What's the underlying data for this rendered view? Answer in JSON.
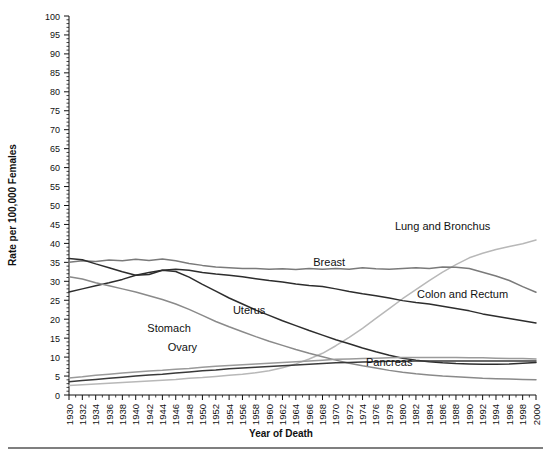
{
  "chart_data": {
    "type": "line",
    "title": "",
    "xlabel": "Year of Death",
    "ylabel": "Rate per 100,000 Females",
    "xlim": [
      1930,
      2000
    ],
    "ylim": [
      0,
      100
    ],
    "ytick_step": 5,
    "xtick_step": 2,
    "grid": false,
    "legend_position": "inline-annotations",
    "yticks": [
      "0",
      "5",
      "10",
      "15",
      "20",
      "25",
      "30",
      "35",
      "40",
      "45",
      "50",
      "55",
      "60",
      "65",
      "70",
      "75",
      "80",
      "85",
      "90",
      "95",
      "100"
    ],
    "xticks": [
      "1930",
      "1932",
      "1934",
      "1936",
      "1938",
      "1940",
      "1942",
      "1944",
      "1946",
      "1948",
      "1950",
      "1952",
      "1954",
      "1956",
      "1958",
      "1960",
      "1962",
      "1964",
      "1966",
      "1968",
      "1970",
      "1972",
      "1974",
      "1976",
      "1978",
      "1980",
      "1982",
      "1984",
      "1986",
      "1988",
      "1990",
      "1992",
      "1994",
      "1996",
      "1998",
      "2000"
    ],
    "x": [
      1930,
      1932,
      1934,
      1936,
      1938,
      1940,
      1942,
      1944,
      1946,
      1948,
      1950,
      1952,
      1954,
      1956,
      1958,
      1960,
      1962,
      1964,
      1966,
      1968,
      1970,
      1972,
      1974,
      1976,
      1978,
      1980,
      1982,
      1984,
      1986,
      1988,
      1990,
      1992,
      1994,
      1996,
      1998,
      2000
    ],
    "series": [
      {
        "name": "Lung and Bronchus",
        "color": "#b8b8b8",
        "label_x": 1986,
        "label_y": 43.5,
        "values": [
          2.5,
          2.7,
          2.9,
          3.1,
          3.3,
          3.5,
          3.7,
          3.9,
          4.1,
          4.4,
          4.6,
          4.9,
          5.2,
          5.5,
          5.9,
          6.4,
          7.2,
          8.2,
          9.5,
          11.0,
          13.0,
          15.2,
          17.6,
          20.2,
          22.8,
          25.4,
          27.8,
          30.2,
          32.4,
          34.4,
          36.2,
          37.4,
          38.4,
          39.2,
          39.9,
          40.9
        ]
      },
      {
        "name": "Breast",
        "color": "#7a7a7a",
        "label_x": 1969,
        "label_y": 34.0,
        "values": [
          35.0,
          35.4,
          35.2,
          35.6,
          35.4,
          35.8,
          35.5,
          35.9,
          35.4,
          34.7,
          34.2,
          33.8,
          33.6,
          33.4,
          33.4,
          33.2,
          33.3,
          33.1,
          33.4,
          33.2,
          33.4,
          33.2,
          33.6,
          33.3,
          33.2,
          33.4,
          33.6,
          33.4,
          33.8,
          33.7,
          33.4,
          32.4,
          31.4,
          30.2,
          28.6,
          27.1
        ]
      },
      {
        "name": "Colon and Rectum",
        "color": "#2d2d2d",
        "label_x": 1989,
        "label_y": 25.5,
        "values": [
          27.2,
          28.0,
          28.8,
          29.6,
          30.5,
          31.6,
          32.3,
          32.9,
          33.2,
          32.9,
          32.3,
          31.9,
          31.6,
          31.2,
          30.7,
          30.2,
          29.8,
          29.3,
          28.9,
          28.6,
          28.0,
          27.3,
          26.7,
          26.2,
          25.6,
          24.9,
          24.4,
          24.0,
          23.4,
          22.8,
          22.2,
          21.4,
          20.8,
          20.2,
          19.6,
          19.0
        ]
      },
      {
        "name": "Uterus",
        "color": "#2d2d2d",
        "label_x": 1957,
        "label_y": 21.5,
        "values": [
          36.0,
          35.7,
          34.6,
          33.6,
          32.5,
          31.6,
          31.8,
          32.9,
          32.6,
          31.1,
          29.2,
          27.4,
          25.6,
          24.0,
          22.4,
          21.0,
          19.6,
          18.3,
          17.0,
          15.8,
          14.6,
          13.5,
          12.4,
          11.4,
          10.5,
          9.7,
          9.2,
          8.8,
          8.5,
          8.3,
          8.2,
          8.1,
          8.1,
          8.2,
          8.4,
          8.6
        ]
      },
      {
        "name": "Stomach",
        "color": "#8a8a8a",
        "label_x": 1945,
        "label_y": 16.5,
        "values": [
          31.2,
          30.6,
          29.6,
          28.8,
          28.0,
          27.2,
          26.2,
          25.2,
          24.0,
          22.6,
          21.0,
          19.4,
          18.0,
          16.7,
          15.4,
          14.2,
          13.1,
          12.0,
          11.0,
          10.1,
          9.2,
          8.4,
          7.7,
          7.1,
          6.5,
          6.0,
          5.6,
          5.3,
          5.0,
          4.8,
          4.6,
          4.4,
          4.3,
          4.2,
          4.1,
          4.0
        ]
      },
      {
        "name": "Ovary",
        "color": "#9a9a9a",
        "label_x": 1947,
        "label_y": 11.5,
        "values": [
          4.5,
          4.8,
          5.2,
          5.5,
          5.8,
          6.1,
          6.3,
          6.5,
          6.8,
          7.0,
          7.3,
          7.6,
          7.8,
          8.0,
          8.2,
          8.4,
          8.6,
          8.8,
          9.0,
          9.2,
          9.4,
          9.5,
          9.6,
          9.7,
          9.8,
          9.9,
          9.9,
          9.9,
          9.9,
          9.9,
          9.8,
          9.8,
          9.7,
          9.6,
          9.6,
          9.5
        ]
      },
      {
        "name": "Pancreas",
        "color": "#3a3a3a",
        "label_x": 1978,
        "label_y": 7.7,
        "values": [
          3.5,
          3.8,
          4.1,
          4.4,
          4.7,
          5.0,
          5.3,
          5.5,
          5.8,
          6.1,
          6.4,
          6.6,
          6.9,
          7.1,
          7.3,
          7.5,
          7.7,
          7.9,
          8.1,
          8.3,
          8.5,
          8.6,
          8.7,
          8.8,
          8.9,
          8.9,
          9.0,
          9.0,
          9.0,
          9.0,
          9.0,
          9.0,
          9.0,
          9.0,
          9.0,
          9.0
        ]
      }
    ]
  }
}
